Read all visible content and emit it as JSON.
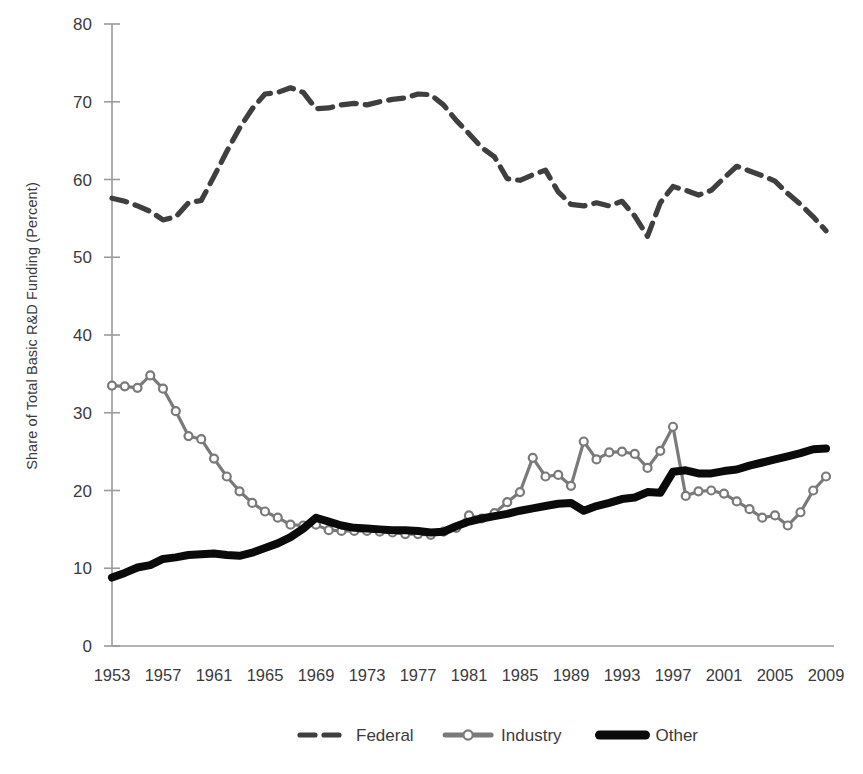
{
  "chart_data": {
    "type": "line",
    "title": "",
    "xlabel": "",
    "ylabel": "Share of Total Basic R&D Funding (Percent)",
    "xlim": [
      1953,
      2009
    ],
    "ylim": [
      0,
      80
    ],
    "ytick_step": 10,
    "xtick_step": 4,
    "grid": false,
    "legend_position": "bottom",
    "yticks": [
      "0",
      "10",
      "20",
      "30",
      "40",
      "50",
      "60",
      "70",
      "80"
    ],
    "xticks": [
      "1953",
      "1957",
      "1961",
      "1965",
      "1969",
      "1973",
      "1977",
      "1981",
      "1985",
      "1989",
      "1993",
      "1997",
      "2001",
      "2005",
      "2009"
    ],
    "x": [
      1953,
      1954,
      1955,
      1956,
      1957,
      1958,
      1959,
      1960,
      1961,
      1962,
      1963,
      1964,
      1965,
      1966,
      1967,
      1968,
      1969,
      1970,
      1971,
      1972,
      1973,
      1974,
      1975,
      1976,
      1977,
      1978,
      1979,
      1980,
      1981,
      1982,
      1983,
      1984,
      1985,
      1986,
      1987,
      1988,
      1989,
      1990,
      1991,
      1992,
      1993,
      1994,
      1995,
      1996,
      1997,
      1998,
      1999,
      2000,
      2001,
      2002,
      2003,
      2004,
      2005,
      2006,
      2007,
      2008,
      2009
    ],
    "series": [
      {
        "name": "Federal",
        "style": "dashed",
        "color": "#3f3f3f",
        "marker": "none",
        "values": [
          57.6,
          57.2,
          56.6,
          55.9,
          54.8,
          55.2,
          57.0,
          57.3,
          60.4,
          63.6,
          66.6,
          69.1,
          71.0,
          71.2,
          71.8,
          71.2,
          69.1,
          69.2,
          69.6,
          69.8,
          69.6,
          70.0,
          70.3,
          70.5,
          71.0,
          70.9,
          69.6,
          67.6,
          65.9,
          64.1,
          62.9,
          60.1,
          59.9,
          60.6,
          61.2,
          58.4,
          56.8,
          56.6,
          57.0,
          56.6,
          57.2,
          55.3,
          52.7,
          57.0,
          59.1,
          58.6,
          58.0,
          58.6,
          60.2,
          61.7,
          61.1,
          60.5,
          59.8,
          58.2,
          56.8,
          55.2,
          53.4
        ]
      },
      {
        "name": "Industry",
        "style": "solid",
        "color": "#7a7a7a",
        "marker": "circle",
        "values": [
          33.5,
          33.4,
          33.2,
          34.8,
          33.1,
          30.2,
          27.0,
          26.6,
          24.1,
          21.8,
          19.9,
          18.4,
          17.3,
          16.5,
          15.6,
          15.5,
          15.6,
          14.9,
          14.8,
          14.8,
          14.8,
          14.7,
          14.6,
          14.4,
          14.4,
          14.3,
          14.7,
          15.2,
          16.8,
          16.4,
          17.1,
          18.5,
          19.8,
          24.2,
          21.8,
          22.0,
          20.6,
          26.3,
          24.0,
          24.9,
          25.0,
          24.7,
          22.9,
          25.1,
          28.2,
          19.3,
          19.9,
          20.0,
          19.6,
          18.6,
          17.6,
          16.5,
          16.8,
          15.5,
          17.2,
          20.0,
          21.8
        ]
      },
      {
        "name": "Other",
        "style": "solid",
        "color": "#0a0a0a",
        "marker": "none",
        "values": [
          8.8,
          9.4,
          10.1,
          10.4,
          11.2,
          11.4,
          11.7,
          11.8,
          11.9,
          11.7,
          11.6,
          12.0,
          12.6,
          13.2,
          14.0,
          15.1,
          16.5,
          16.0,
          15.5,
          15.2,
          15.1,
          15.0,
          14.9,
          14.9,
          14.8,
          14.6,
          14.7,
          15.4,
          16.0,
          16.4,
          16.7,
          17.0,
          17.4,
          17.7,
          18.0,
          18.3,
          18.4,
          17.4,
          18.0,
          18.4,
          18.9,
          19.1,
          19.8,
          19.7,
          22.4,
          22.6,
          22.2,
          22.2,
          22.5,
          22.7,
          23.2,
          23.6,
          24.0,
          24.4,
          24.8,
          25.3,
          25.4
        ]
      }
    ]
  },
  "legend": {
    "items": [
      {
        "label": "Federal",
        "swatch": "dashed-line-swatch"
      },
      {
        "label": "Industry",
        "swatch": "marker-line-swatch"
      },
      {
        "label": "Other",
        "swatch": "thick-line-swatch"
      }
    ]
  }
}
